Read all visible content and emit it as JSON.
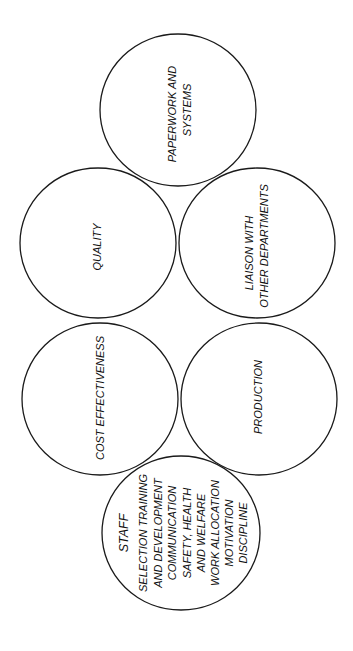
{
  "diagram": {
    "style": {
      "stroke_color": "#1a1a1a",
      "text_color": "#111111",
      "background": "#ffffff"
    },
    "circles": [
      {
        "id": "paperwork",
        "cx": 178,
        "cy": 110,
        "rx": 78,
        "ry": 76,
        "lines": [
          {
            "text": "PAPERWORK AND",
            "x": 172,
            "y": 114,
            "size": 11
          },
          {
            "text": "SYSTEMS",
            "x": 187,
            "y": 110,
            "size": 11
          }
        ]
      },
      {
        "id": "quality",
        "cx": 98,
        "cy": 243,
        "rx": 78,
        "ry": 75,
        "lines": [
          {
            "text": "QUALITY",
            "x": 97,
            "y": 247,
            "size": 11
          }
        ]
      },
      {
        "id": "liaison",
        "cx": 257,
        "cy": 243,
        "rx": 78,
        "ry": 75,
        "lines": [
          {
            "text": "LIAISON WITH",
            "x": 249,
            "y": 253,
            "size": 11
          },
          {
            "text": "OTHER DEPARTMENTS",
            "x": 264,
            "y": 246,
            "size": 11
          }
        ]
      },
      {
        "id": "cost",
        "cx": 100,
        "cy": 399,
        "rx": 78,
        "ry": 76,
        "lines": [
          {
            "text": "COST EFFECTIVENESS",
            "x": 100,
            "y": 398,
            "size": 11
          }
        ]
      },
      {
        "id": "production",
        "cx": 259,
        "cy": 399,
        "rx": 78,
        "ry": 76,
        "lines": [
          {
            "text": "PRODUCTION",
            "x": 258,
            "y": 397,
            "size": 11
          }
        ]
      },
      {
        "id": "staff",
        "cx": 181,
        "cy": 533,
        "rx": 79,
        "ry": 77,
        "lines": [
          {
            "text": "STAFF",
            "x": 124,
            "y": 533,
            "size": 12.5
          },
          {
            "text": "SELECTION TRAINING",
            "x": 143,
            "y": 533,
            "size": 11
          },
          {
            "text": "AND DEVELOPMENT",
            "x": 158,
            "y": 533,
            "size": 11
          },
          {
            "text": "COMMUNICATION",
            "x": 172,
            "y": 533,
            "size": 11
          },
          {
            "text": "SAFETY, HEALTH",
            "x": 187,
            "y": 533,
            "size": 11
          },
          {
            "text": "AND WELFARE",
            "x": 201,
            "y": 533,
            "size": 11
          },
          {
            "text": "WORK ALLOCATION",
            "x": 215,
            "y": 533,
            "size": 11
          },
          {
            "text": "MOTIVATION",
            "x": 229,
            "y": 533,
            "size": 11
          },
          {
            "text": "DISCIPLINE",
            "x": 243,
            "y": 533,
            "size": 11
          }
        ]
      }
    ]
  }
}
